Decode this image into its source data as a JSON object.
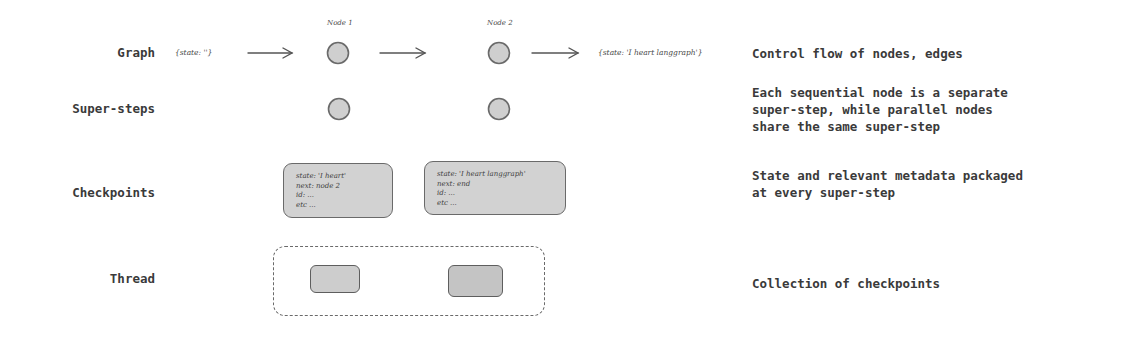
{
  "rows": {
    "graph": {
      "label": "Graph",
      "description": "Control flow of nodes, edges",
      "input_state": "{state: ''}",
      "output_state": "{state: 'I heart langgraph'}",
      "nodes": [
        {
          "label": "Node 1"
        },
        {
          "label": "Node 2"
        }
      ]
    },
    "super_steps": {
      "label": "Super-steps",
      "description": "Each sequential node is a separate\nsuper-step, while parallel nodes\nshare the same super-step"
    },
    "checkpoints": {
      "label": "Checkpoints",
      "description": "State and relevant metadata packaged\nat every super-step",
      "items": [
        {
          "state": "state: 'I heart'",
          "next": "next: node 2",
          "id": "id: ...",
          "etc": "etc ..."
        },
        {
          "state": "state: 'I heart langgraph'",
          "next": "next: end",
          "id": "id: ...",
          "etc": "etc ..."
        }
      ]
    },
    "thread": {
      "label": "Thread",
      "description": "Collection of checkpoints"
    }
  },
  "colors": {
    "node_fill": "#cfcfcf",
    "node_stroke": "#6a6a6a",
    "text": "#3a3a3a",
    "arrow": "#555555"
  }
}
